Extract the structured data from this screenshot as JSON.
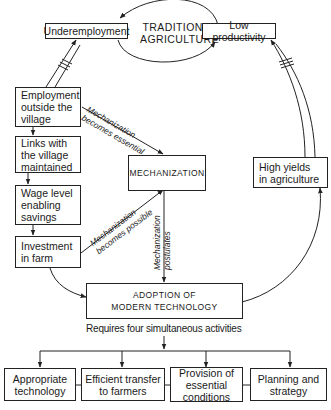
{
  "cycle": {
    "center_label": "TRADITIONAL\nAGRICULTURE",
    "left_node": "Underemployment",
    "right_node": "Low productivity"
  },
  "left_chain": [
    {
      "label": "Employment\noutside the\nvillage"
    },
    {
      "label": "Links with\nthe village\nmaintained"
    },
    {
      "label": "Wage level\nenabling\nsavings"
    },
    {
      "label": "Investment\nin farm"
    }
  ],
  "mechanization": {
    "label": "MECHANIZATION",
    "edge_essential": "Mechanization\nbecomes essential",
    "edge_possible": "Mechanization\nbecomes possible",
    "edge_postulates": "Mechanization\npostulates"
  },
  "high_yields": {
    "label": "High yields\nin agriculture"
  },
  "adoption": {
    "label": "ADOPTION OF\nMODERN TECHNOLOGY",
    "caption": "Requires four simultaneous activities"
  },
  "activities": [
    {
      "label": "Appropriate\ntechnology"
    },
    {
      "label": "Efficient transfer\nto farmers"
    },
    {
      "label": "Provision of\nessential\nconditions"
    },
    {
      "label": "Planning and\nstrategy"
    }
  ]
}
